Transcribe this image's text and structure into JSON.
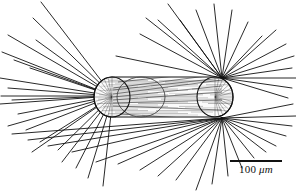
{
  "figure": {
    "background_color": "#ffffff",
    "ink_color": "#111111",
    "texture_color": "#7a7a7a",
    "width": 296,
    "height": 192
  },
  "scale_bar": {
    "value": "100",
    "unit": "μm",
    "label": "100 μm",
    "bar_length_px": 52,
    "bar_color": "#111111"
  },
  "organism": {
    "body": {
      "shape": "capsule",
      "left_cap_center_x": 112,
      "right_cap_center_x": 215,
      "center_y": 97,
      "half_height": 20,
      "cap_radius_x": 18,
      "outline_color": "#111111",
      "fill_color": "#fbfbfb"
    },
    "inner_circle": {
      "center_x": 141,
      "center_y": 97,
      "radius_x": 24,
      "radius_y": 20,
      "outline_color": "#333333"
    },
    "striations": {
      "count": 26,
      "orientation": "horizontal",
      "color": "#6f6f6f"
    },
    "spine_foci": [
      {
        "name": "left-focus",
        "x": 113,
        "y": 96
      },
      {
        "name": "upper-right-focus",
        "x": 222,
        "y": 78
      },
      {
        "name": "lower-right-focus",
        "x": 222,
        "y": 118
      }
    ],
    "spines": {
      "left_count": 22,
      "upper_right_count": 18,
      "lower_right_count": 20,
      "color": "#111111"
    }
  },
  "spine_paths": {
    "left": [
      [
        113,
        96,
        41,
        2
      ],
      [
        113,
        96,
        33,
        18
      ],
      [
        113,
        96,
        8,
        35
      ],
      [
        113,
        96,
        36,
        40
      ],
      [
        113,
        96,
        2,
        52
      ],
      [
        113,
        96,
        14,
        60
      ],
      [
        113,
        96,
        30,
        68
      ],
      [
        113,
        96,
        0,
        78
      ],
      [
        113,
        96,
        8,
        88
      ],
      [
        113,
        96,
        1,
        96
      ],
      [
        113,
        96,
        12,
        100
      ],
      [
        113,
        96,
        0,
        104
      ],
      [
        113,
        96,
        18,
        114
      ],
      [
        113,
        96,
        8,
        126
      ],
      [
        113,
        96,
        26,
        130
      ],
      [
        113,
        96,
        40,
        142
      ],
      [
        113,
        96,
        32,
        152
      ],
      [
        113,
        96,
        58,
        150
      ],
      [
        113,
        96,
        62,
        162
      ],
      [
        113,
        96,
        76,
        168
      ],
      [
        113,
        96,
        88,
        178
      ],
      [
        113,
        96,
        103,
        186
      ]
    ],
    "upper_right": [
      [
        222,
        78,
        116,
        56
      ],
      [
        222,
        78,
        140,
        34
      ],
      [
        222,
        78,
        158,
        20
      ],
      [
        222,
        78,
        146,
        18
      ],
      [
        222,
        78,
        168,
        4
      ],
      [
        222,
        78,
        180,
        20
      ],
      [
        222,
        78,
        196,
        10
      ],
      [
        222,
        78,
        214,
        4
      ],
      [
        222,
        78,
        232,
        10
      ],
      [
        222,
        78,
        248,
        22
      ],
      [
        222,
        78,
        262,
        36
      ],
      [
        222,
        78,
        276,
        30
      ],
      [
        222,
        78,
        286,
        44
      ],
      [
        222,
        78,
        294,
        56
      ],
      [
        222,
        78,
        292,
        68
      ],
      [
        222,
        78,
        296,
        78
      ],
      [
        222,
        78,
        292,
        88
      ],
      [
        222,
        78,
        288,
        98
      ]
    ],
    "lower_right": [
      [
        222,
        118,
        293,
        104
      ],
      [
        222,
        118,
        296,
        116
      ],
      [
        222,
        118,
        292,
        126
      ],
      [
        222,
        118,
        286,
        136
      ],
      [
        222,
        118,
        276,
        146
      ],
      [
        222,
        118,
        266,
        152
      ],
      [
        222,
        118,
        254,
        158
      ],
      [
        222,
        118,
        242,
        168
      ],
      [
        222,
        118,
        228,
        176
      ],
      [
        222,
        118,
        212,
        184
      ],
      [
        222,
        118,
        196,
        190
      ],
      [
        222,
        118,
        176,
        180
      ],
      [
        222,
        118,
        158,
        176
      ],
      [
        222,
        118,
        140,
        170
      ],
      [
        222,
        118,
        118,
        164
      ],
      [
        222,
        118,
        96,
        162
      ],
      [
        222,
        118,
        72,
        152
      ],
      [
        222,
        118,
        48,
        146
      ],
      [
        222,
        118,
        28,
        140
      ],
      [
        222,
        118,
        12,
        134
      ]
    ],
    "internal_long": [
      [
        113,
        90,
        222,
        78
      ],
      [
        113,
        94,
        222,
        80
      ],
      [
        113,
        97,
        222,
        86
      ],
      [
        113,
        100,
        222,
        92
      ],
      [
        113,
        103,
        222,
        100
      ],
      [
        113,
        106,
        222,
        110
      ],
      [
        113,
        88,
        222,
        74
      ],
      [
        118,
        82,
        214,
        72
      ],
      [
        120,
        114,
        216,
        120
      ]
    ]
  }
}
